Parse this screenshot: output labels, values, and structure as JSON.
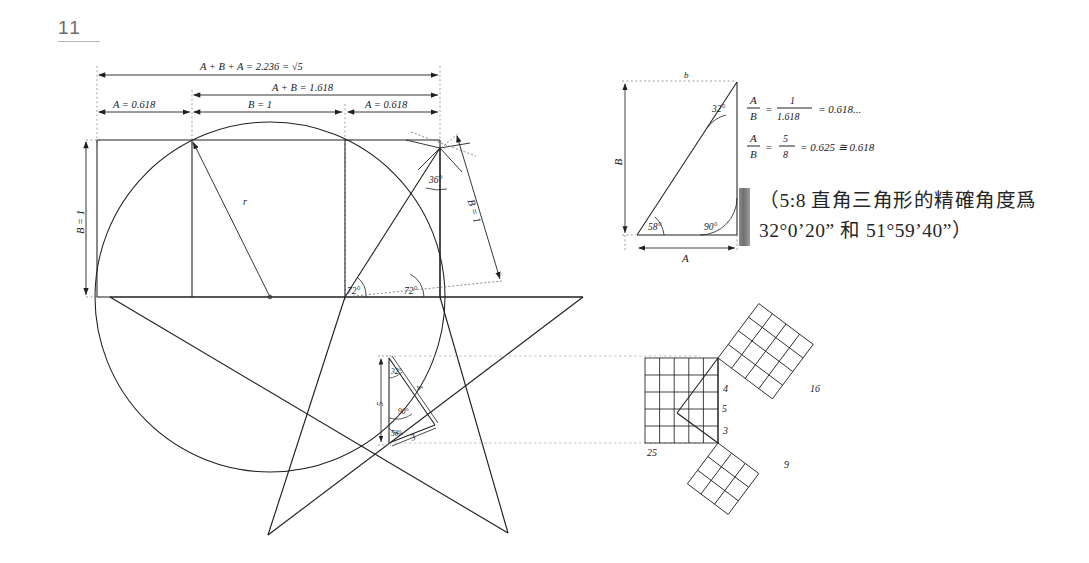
{
  "page": {
    "folio": "11"
  },
  "top_dimensions": {
    "total": "A + B + A = 2.236 = √5",
    "ab": "A + B = 1.618",
    "left_a": "A = 0.618",
    "middle_b": "B = 1",
    "right_a": "A = 0.618"
  },
  "main_diagram": {
    "left_vertical_label": "B = 1",
    "radius_label": "r",
    "slant_label": "B = 1",
    "apex_angle": "36°",
    "base_angle_left": "72°",
    "base_angle_right": "72°"
  },
  "small_triangle": {
    "hypotenuse_label": "5",
    "vertical_label": "5",
    "side_4_label": "4",
    "side_3_label": "3",
    "angle_top": "32°",
    "angle_right": "90°",
    "angle_bottom": "58°"
  },
  "right_triangle": {
    "top_label": "b",
    "vertical_label": "B",
    "bottom_label": "A",
    "angle_top": "32°",
    "angle_left": "58°",
    "angle_right": "90°"
  },
  "equations": {
    "numerator_1": "A",
    "denominator_1": "B",
    "eq1_frac_num": "1",
    "eq1_frac_den": "1.618",
    "eq1_result": "= 0.618...",
    "eq2_frac_num": "5",
    "eq2_frac_den": "8",
    "eq2_result": "= 0.625 ≅ 0.618"
  },
  "pythagoras": {
    "square_25_label": "25",
    "square_16_label": "16",
    "square_9_label": "9",
    "side_5_label": "5",
    "side_4_label": "4",
    "side_3_label": "3"
  },
  "annotation": {
    "line1": "（5:8 直角三角形的精確角度爲",
    "line2": "32°0’20” 和 51°59’40”）"
  },
  "colors": {
    "ink": "#20201f",
    "folio": "#6d6d6d",
    "bar": "#7d7d7d"
  }
}
